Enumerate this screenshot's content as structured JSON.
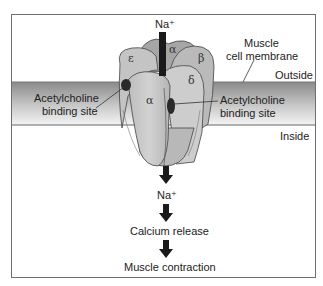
{
  "diagram": {
    "top_ion": "Na⁺",
    "membrane_label_line1": "Muscle",
    "membrane_label_line2": "cell membrane",
    "outside_label": "Outside",
    "inside_label": "Inside",
    "left_binding_line1": "Acetylcholine",
    "left_binding_line2": "binding site",
    "right_binding_line1": "Acetylcholine",
    "right_binding_line2": "binding site",
    "subunits": {
      "epsilon": "ε",
      "alpha_top": "α",
      "beta": "β",
      "delta": "δ",
      "alpha_front": "α"
    },
    "cascade": [
      "Na⁺",
      "Calcium release",
      "Muscle contraction"
    ],
    "colors": {
      "membrane_top": "#8a8a8a",
      "membrane_bottom": "#f2f2f2",
      "protein_fill": "#c9c9c9",
      "protein_dark": "#a9a9a9",
      "channel": "#1a1a1a",
      "border": "#6e6e6e"
    }
  }
}
